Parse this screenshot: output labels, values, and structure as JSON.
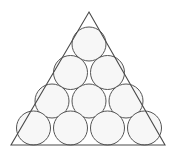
{
  "figure": {
    "kind": "geometry-diagram",
    "canvas": {
      "width": 176,
      "height": 154
    },
    "background_color": "#ffffff"
  },
  "triangle": {
    "name": "enclosing-triangle",
    "apex": {
      "x": 89,
      "y": 12
    },
    "bottom_left": {
      "x": 11,
      "y": 145
    },
    "bottom_right": {
      "x": 165,
      "y": 145
    },
    "base_length": 154,
    "height": 133,
    "stroke_color": "#4a4a4a",
    "stroke_width": 1.1,
    "fill_color": "none"
  },
  "circles": {
    "count": 10,
    "radius": 17,
    "diameter": 34,
    "fill_color": "#f7f7f7",
    "stroke_color": "#555555",
    "stroke_width": 1,
    "row_counts": [
      1,
      2,
      3,
      4
    ],
    "rows": [
      {
        "row_index": 1,
        "count": 1,
        "center_y": 44,
        "items": [
          {
            "id": "circle-r1-c1",
            "cx": 89,
            "cy": 44
          }
        ]
      },
      {
        "row_index": 2,
        "count": 2,
        "center_y": 72.5,
        "items": [
          {
            "id": "circle-r2-c1",
            "cx": 70.5,
            "cy": 72.5
          },
          {
            "id": "circle-r2-c2",
            "cx": 107.5,
            "cy": 72.5
          }
        ]
      },
      {
        "row_index": 3,
        "count": 3,
        "center_y": 101,
        "items": [
          {
            "id": "circle-r3-c1",
            "cx": 52,
            "cy": 101
          },
          {
            "id": "circle-r3-c2",
            "cx": 89,
            "cy": 101
          },
          {
            "id": "circle-r3-c3",
            "cx": 126,
            "cy": 101
          }
        ]
      },
      {
        "row_index": 4,
        "count": 4,
        "center_y": 128,
        "items": [
          {
            "id": "circle-r4-c1",
            "cx": 33.5,
            "cy": 128
          },
          {
            "id": "circle-r4-c2",
            "cx": 70.5,
            "cy": 128
          },
          {
            "id": "circle-r4-c3",
            "cx": 107.5,
            "cy": 128
          },
          {
            "id": "circle-r4-c4",
            "cx": 144.5,
            "cy": 128
          }
        ]
      }
    ]
  }
}
